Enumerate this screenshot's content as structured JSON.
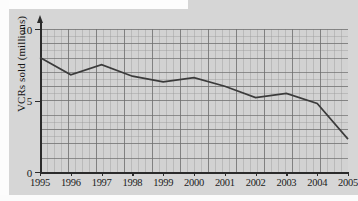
{
  "chart_data": {
    "type": "line",
    "title": "",
    "subtitle": "",
    "xlabel": "",
    "ylabel": "VCRs sold  (millions)",
    "categories": [
      "1995",
      "1996",
      "1997",
      "1998",
      "1999",
      "2000",
      "2001",
      "2002",
      "2003",
      "2004",
      "2005"
    ],
    "values": [
      8.0,
      6.8,
      7.5,
      6.7,
      6.3,
      6.6,
      6.0,
      5.2,
      5.5,
      4.8,
      2.3
    ],
    "series": [
      {
        "name": "VCRs sold",
        "values": [
          8.0,
          6.8,
          7.5,
          6.7,
          6.3,
          6.6,
          6.0,
          5.2,
          5.5,
          4.8,
          2.3
        ]
      }
    ],
    "xlim": [
      1995,
      2005
    ],
    "ylim": [
      0,
      10
    ],
    "yticks": [
      "0",
      "5",
      "10"
    ],
    "ytick_values": [
      0,
      5,
      10
    ],
    "xticks": [
      "1995",
      "1996",
      "1997",
      "1998",
      "1999",
      "2000",
      "2001",
      "2002",
      "2003",
      "2004",
      "2005"
    ],
    "grid": true,
    "legend": "none",
    "line_color": "#3b3b3b",
    "plot_background": "#d2d2d2",
    "grid_color": "#6e6e6e",
    "axis_color": "#2b2b2b"
  },
  "axis": {
    "y_title": "VCRs sold  (millions)",
    "y_ticks": [
      {
        "label": "10",
        "value": 10
      },
      {
        "label": "5",
        "value": 5
      },
      {
        "label": "0",
        "value": 0
      }
    ],
    "x_ticks": [
      {
        "label": "1995"
      },
      {
        "label": "1996"
      },
      {
        "label": "1997"
      },
      {
        "label": "1998"
      },
      {
        "label": "1999"
      },
      {
        "label": "2000"
      },
      {
        "label": "2001"
      },
      {
        "label": "2002"
      },
      {
        "label": "2003"
      },
      {
        "label": "2004"
      },
      {
        "label": "2005"
      }
    ]
  }
}
